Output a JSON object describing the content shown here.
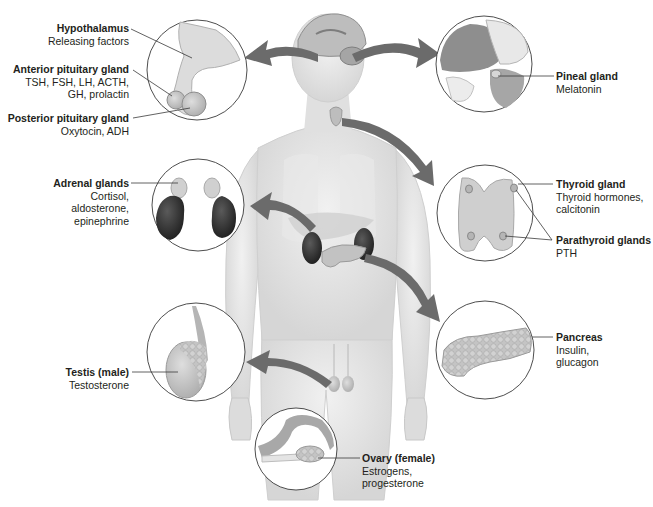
{
  "figure": {
    "colors": {
      "arrow": "#6b6b6b",
      "circle_stroke": "#3a3a3a",
      "skin": "#e4e4e4",
      "kidney": "#3b3b3b",
      "gland": "#c9c9c9"
    },
    "labels": {
      "hypothalamus": {
        "title": "Hypothalamus",
        "hormones": "Releasing factors"
      },
      "anterior_pituitary": {
        "title": "Anterior pituitary gland",
        "hormones": "TSH, FSH, LH, ACTH,\nGH, prolactin"
      },
      "posterior_pituitary": {
        "title": "Posterior pituitary gland",
        "hormones": "Oxytocin, ADH"
      },
      "pineal": {
        "title": "Pineal gland",
        "hormones": "Melatonin"
      },
      "thyroid": {
        "title": "Thyroid gland",
        "hormones": "Thyroid hormones,\ncalcitonin"
      },
      "parathyroid": {
        "title": "Parathyroid glands",
        "hormones": "PTH"
      },
      "adrenal": {
        "title": "Adrenal glands",
        "hormones": "Cortisol,\naldosterone,\nepinephrine"
      },
      "pancreas": {
        "title": "Pancreas",
        "hormones": "Insulin,\nglucagon"
      },
      "testis": {
        "title": "Testis (male)",
        "hormones": "Testosterone"
      },
      "ovary": {
        "title": "Ovary (female)",
        "hormones": "Estrogens,\nprogesterone"
      }
    }
  }
}
